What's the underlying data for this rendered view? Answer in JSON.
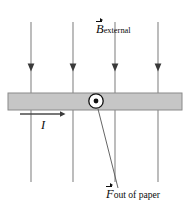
{
  "figure": {
    "background_color": "#ffffff",
    "width": 189,
    "height": 212,
    "labels": {
      "b_field": {
        "symbol": "B",
        "subscript": "external",
        "vector": true
      },
      "force": {
        "symbol": "F",
        "annotation": "out of paper",
        "vector": true
      },
      "current": {
        "symbol": "I",
        "vector": false
      }
    },
    "colors": {
      "bar_fill": "#c6c6c6",
      "bar_edge": "#8a8a8a",
      "field_line": "#8c8c8c",
      "arrow_head": "#3a3a3a",
      "ink": "#0d0d0d",
      "leader_line": "#5d5d5d",
      "current_arrow": "#4a4a4a",
      "symbol_fill": "#ffffff"
    },
    "conductor_bar": {
      "x": 8,
      "y": 93,
      "width": 174,
      "height": 17
    },
    "field_lines": {
      "count": 4,
      "direction": "downward",
      "x_positions": [
        31,
        73,
        115,
        158
      ],
      "y_top": 22,
      "y_bottom": 182,
      "arrow_y": 68
    },
    "out_of_page_symbol": {
      "cx": 96,
      "cy": 101,
      "outer_radius": 7.2,
      "inner_radius": 2.4,
      "meaning": "dot-in-circle-out-of-page"
    },
    "current_arrow": {
      "x_start": 20,
      "x_end": 64,
      "y": 114,
      "direction": "right"
    },
    "force_leader_line": {
      "x_start": 98,
      "y_start": 109,
      "x_end": 118,
      "y_end": 188
    }
  }
}
